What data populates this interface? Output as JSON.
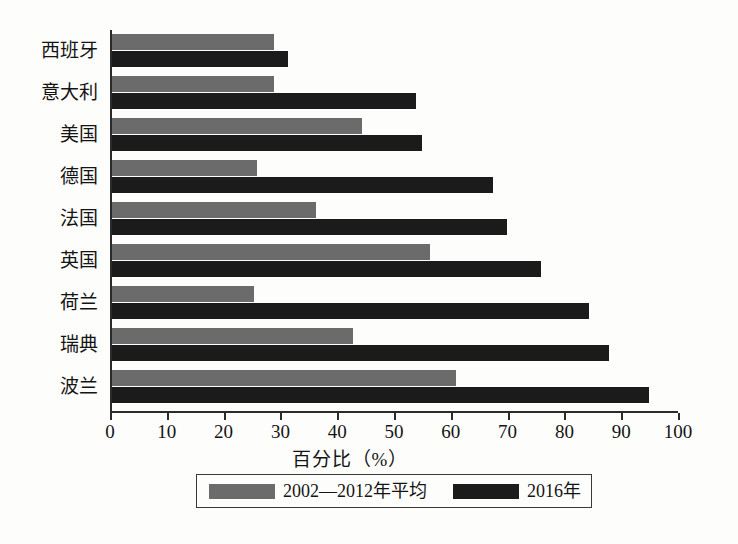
{
  "chart_data": {
    "type": "bar",
    "orientation": "horizontal",
    "title": "",
    "xlabel": "百分比（%）",
    "ylabel": "",
    "xlim": [
      0,
      100
    ],
    "xticks": [
      0,
      10,
      20,
      30,
      40,
      50,
      60,
      70,
      80,
      90,
      100
    ],
    "grid": false,
    "legend_position": "bottom",
    "categories": [
      "西班牙",
      "意大利",
      "美国",
      "德国",
      "法国",
      "英国",
      "荷兰",
      "瑞典",
      "波兰"
    ],
    "series": [
      {
        "name": "2002—2012年平均",
        "color": "#6b6b6b",
        "values": [
          28.5,
          28.5,
          44,
          25.5,
          36,
          56,
          25,
          42.5,
          60.5
        ]
      },
      {
        "name": "2016年",
        "color": "#1b1b1b",
        "values": [
          31,
          53.5,
          54.5,
          67,
          69.5,
          75.5,
          84,
          87.5,
          94.5
        ]
      }
    ]
  },
  "legend": {
    "items": [
      {
        "label": "2002—2012年平均",
        "color": "#6b6b6b"
      },
      {
        "label": "2016年",
        "color": "#1b1b1b"
      }
    ]
  },
  "axis": {
    "x_title": "百分比（%）"
  }
}
